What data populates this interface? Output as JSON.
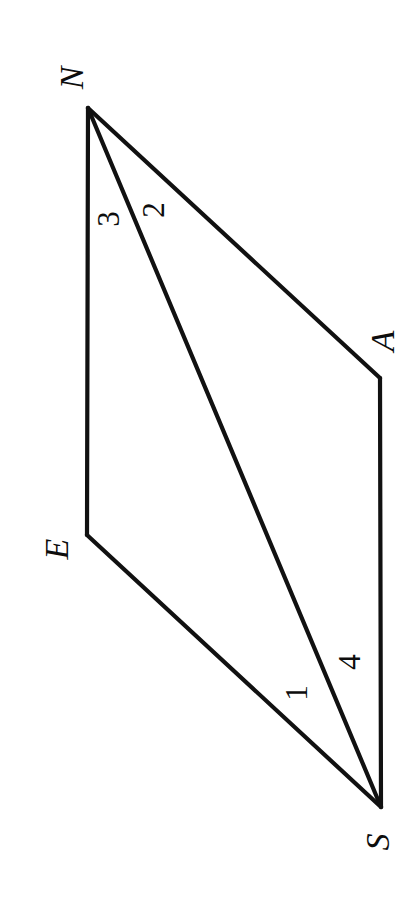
{
  "figure": {
    "background_color": "#ffffff",
    "stroke_color": "#111111",
    "stroke_width": 4.2,
    "text_rotation_deg": -90,
    "canvas": {
      "width": 419,
      "height": 917
    },
    "vertices": [
      {
        "id": "N",
        "label": "N",
        "x": 88,
        "y": 108,
        "label_x": 72,
        "label_y": 78
      },
      {
        "id": "A",
        "label": "A",
        "x": 380,
        "y": 378,
        "label_x": 383,
        "label_y": 341
      },
      {
        "id": "E",
        "label": "E",
        "x": 87,
        "y": 535,
        "label_x": 57,
        "label_y": 549
      },
      {
        "id": "S",
        "label": "S",
        "x": 381,
        "y": 807,
        "label_x": 378,
        "label_y": 842
      }
    ],
    "edges": [
      {
        "id": "NA",
        "from": "N",
        "to": "A"
      },
      {
        "id": "AS",
        "from": "A",
        "to": "S"
      },
      {
        "id": "SE",
        "from": "S",
        "to": "E"
      },
      {
        "id": "EN",
        "from": "E",
        "to": "N"
      }
    ],
    "diagonals": [
      {
        "id": "NS",
        "from": "N",
        "to": "S"
      }
    ],
    "angle_labels": [
      {
        "id": "3",
        "label": "3",
        "x": 108,
        "y": 219,
        "at_vertex": "N",
        "between": "EN and NS"
      },
      {
        "id": "2",
        "label": "2",
        "x": 153,
        "y": 210,
        "at_vertex": "N",
        "between": "NS and NA"
      },
      {
        "id": "1",
        "label": "1",
        "x": 296,
        "y": 693,
        "at_vertex": "S",
        "between": "SE and SN"
      },
      {
        "id": "4",
        "label": "4",
        "x": 349,
        "y": 662,
        "at_vertex": "S",
        "between": "SN and SA"
      }
    ]
  }
}
